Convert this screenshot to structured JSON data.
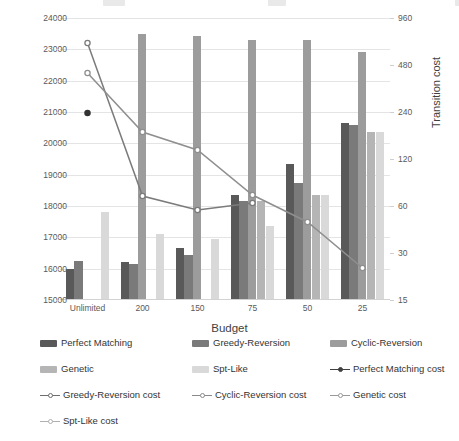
{
  "chart_data": {
    "type": "bar",
    "title": "",
    "xlabel": "Budget",
    "ylabel": "Objective value",
    "y2label": "Transition cost",
    "categories": [
      "Unlimited",
      "200",
      "150",
      "75",
      "50",
      "25"
    ],
    "ylim": [
      15000,
      24000
    ],
    "yticks": [
      "15000",
      "16000",
      "17000",
      "18000",
      "19000",
      "20000",
      "21000",
      "22000",
      "23000",
      "24000"
    ],
    "y2lim": [
      15,
      960
    ],
    "y2scale": "log2",
    "y2ticks": [
      "15",
      "30",
      "60",
      "120",
      "240",
      "480",
      "960"
    ],
    "grid": true,
    "legend_position": "bottom",
    "series": [
      {
        "name": "Perfect Matching",
        "kind": "bar",
        "color": "#595959",
        "values": [
          16000,
          16200,
          16650,
          18350,
          19350,
          20650
        ]
      },
      {
        "name": "Greedy-Reversion",
        "kind": "bar",
        "color": "#7a7a7a",
        "values": [
          16250,
          16150,
          16450,
          18150,
          18750,
          20600
        ]
      },
      {
        "name": "Cyclic-Reversion",
        "kind": "bar",
        "color": "#9c9c9c",
        "values": [
          null,
          23500,
          23430,
          23300,
          23300,
          22900
        ]
      },
      {
        "name": "Genetic",
        "kind": "bar",
        "color": "#b5b5b5",
        "values": [
          null,
          null,
          null,
          18150,
          18350,
          20350
        ]
      },
      {
        "name": "Spt-Like",
        "kind": "bar",
        "color": "#d9d9d9",
        "values": [
          17800,
          17100,
          16950,
          17350,
          18350,
          20350
        ]
      },
      {
        "name": "Perfect Matching cost",
        "kind": "line",
        "color": "#404040",
        "marker": "filled",
        "values": [
          72,
          null,
          null,
          null,
          null,
          null
        ]
      },
      {
        "name": "Greedy-Reversion cost",
        "kind": "line",
        "color": "#6e6e6e",
        "marker": "open",
        "values": [
          660,
          68,
          57,
          48,
          null,
          null
        ]
      },
      {
        "name": "Cyclic-Reversion cost",
        "kind": "line",
        "color": "#8a8a8a",
        "marker": "open",
        "values": [
          660,
          68,
          57,
          48,
          null,
          null
        ]
      },
      {
        "name": "Genetic cost",
        "kind": "line",
        "color": "#9a9a9a",
        "marker": "open",
        "values": [
          360,
          155,
          115,
          72,
          50,
          26
        ]
      },
      {
        "name": "Spt-Like cost",
        "kind": "line",
        "color": "#b0b0b0",
        "marker": "open",
        "values": [
          null,
          null,
          null,
          null,
          null,
          null
        ]
      }
    ],
    "line_points_px": {
      "note": "marker pixel positions read off the plot, plot origin left=60 top=18, height=282",
      "greedy_cost": [
        [
          0,
          43
        ],
        [
          1,
          196
        ],
        [
          2,
          210
        ],
        [
          3,
          203
        ],
        [
          4,
          null
        ],
        [
          5,
          null
        ]
      ],
      "genetic_cost": [
        [
          0,
          73
        ],
        [
          1,
          132
        ],
        [
          2,
          150
        ],
        [
          3,
          195
        ],
        [
          4,
          222
        ],
        [
          5,
          268
        ]
      ],
      "perfect_cost": [
        [
          0,
          113
        ]
      ]
    }
  },
  "legend": {
    "items": [
      {
        "label": "Perfect Matching",
        "type": "bar",
        "color": "#595959"
      },
      {
        "label": "Greedy-Reversion",
        "type": "bar",
        "color": "#7a7a7a"
      },
      {
        "label": "Cyclic-Reversion",
        "type": "bar",
        "color": "#9c9c9c"
      },
      {
        "label": "Genetic",
        "type": "bar",
        "color": "#b5b5b5"
      },
      {
        "label": "Spt-Like",
        "type": "bar",
        "color": "#d9d9d9"
      },
      {
        "label": "Perfect Matching cost",
        "type": "line",
        "color": "#404040",
        "marker": "filled"
      },
      {
        "label": "Greedy-Reversion cost",
        "type": "line",
        "color": "#6e6e6e",
        "marker": "open"
      },
      {
        "label": "Cyclic-Reversion cost",
        "type": "line",
        "color": "#8a8a8a",
        "marker": "open"
      },
      {
        "label": "Genetic cost",
        "type": "line",
        "color": "#9a9a9a",
        "marker": "open"
      },
      {
        "label": "Spt-Like cost",
        "type": "line",
        "color": "#b0b0b0",
        "marker": "open"
      }
    ]
  },
  "colors": {
    "grid": "#e4e4e4",
    "axis_text": "#5a5a5a",
    "label_text": "#3f3f3f",
    "background": "#ffffff"
  }
}
